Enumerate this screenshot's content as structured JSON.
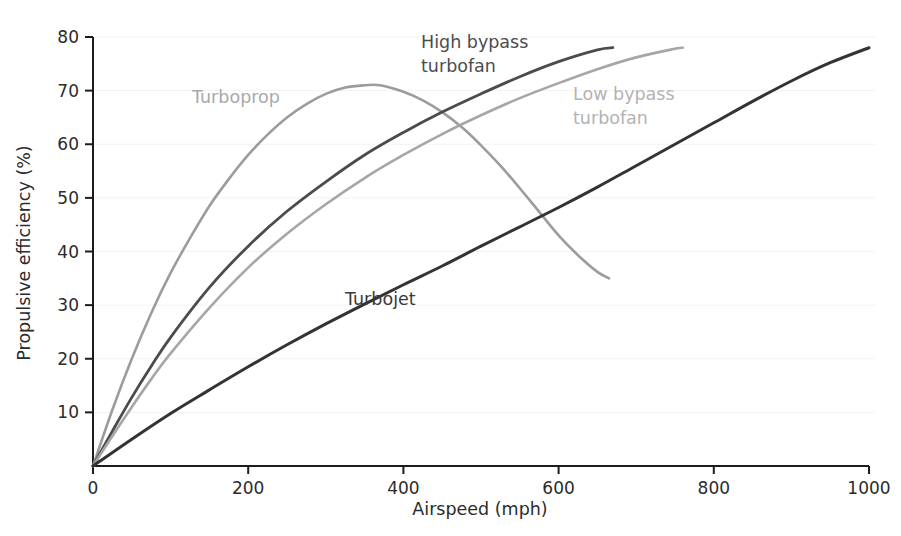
{
  "chart_data": {
    "type": "line",
    "title": "",
    "xlabel": "Airspeed (mph)",
    "ylabel": "Propulsive efficiency (%)",
    "xlim": [
      0,
      1000
    ],
    "ylim": [
      0,
      80
    ],
    "xticks": [
      "0",
      "200",
      "400",
      "600",
      "800",
      "1000"
    ],
    "yticks": [
      "10",
      "20",
      "30",
      "40",
      "50",
      "60",
      "70",
      "80"
    ],
    "xtick_values": [
      0,
      200,
      400,
      600,
      800,
      1000
    ],
    "ytick_values": [
      10,
      20,
      30,
      40,
      50,
      60,
      70,
      80
    ],
    "grid": true,
    "grid_axis": "y",
    "legend": "inline-annotations",
    "series": [
      {
        "name": "Turboprop",
        "color": "#9c9c9c",
        "label_x": 192,
        "label_y": 103,
        "x": [
          0,
          25,
          50,
          75,
          100,
          125,
          150,
          175,
          200,
          225,
          250,
          275,
          300,
          325,
          350,
          370,
          400,
          425,
          450,
          475,
          500,
          525,
          550,
          575,
          600,
          625,
          650,
          665
        ],
        "y": [
          0,
          10.5,
          20.0,
          28.5,
          36.0,
          42.5,
          48.5,
          53.5,
          58.0,
          61.8,
          65.0,
          67.5,
          69.4,
          70.6,
          71.0,
          71.0,
          69.8,
          68.2,
          66.0,
          63.2,
          59.8,
          56.0,
          51.8,
          47.4,
          43.0,
          39.3,
          36.2,
          35.0
        ]
      },
      {
        "name": "High bypass turbofan",
        "color": "#4b4b4b",
        "label_line1": "High bypass",
        "label_line2": "turbofan",
        "label_x": 421,
        "label_y": 48,
        "x": [
          0,
          25,
          50,
          75,
          100,
          150,
          200,
          250,
          300,
          350,
          400,
          450,
          500,
          550,
          600,
          650,
          670
        ],
        "y": [
          0,
          6.5,
          12.8,
          18.6,
          24.0,
          33.3,
          41.0,
          47.5,
          53.0,
          58.0,
          62.2,
          66.0,
          69.4,
          72.6,
          75.4,
          77.6,
          78.0
        ]
      },
      {
        "name": "Low bypass turbofan",
        "color": "#a6a6a6",
        "label_line1": "Low bypass",
        "label_line2": "turbofan",
        "label_x": 573,
        "label_y": 100,
        "x": [
          0,
          25,
          50,
          75,
          100,
          150,
          200,
          250,
          300,
          350,
          400,
          450,
          500,
          550,
          600,
          650,
          700,
          750,
          760
        ],
        "y": [
          0,
          5.6,
          11.0,
          16.2,
          21.0,
          29.5,
          37.0,
          43.3,
          48.8,
          53.7,
          58.0,
          61.9,
          65.4,
          68.6,
          71.4,
          74.0,
          76.2,
          77.8,
          78.0
        ]
      },
      {
        "name": "Turbojet",
        "color": "#333333",
        "label_x": 345,
        "label_y": 305,
        "x": [
          0,
          50,
          100,
          150,
          200,
          250,
          300,
          350,
          400,
          450,
          500,
          550,
          600,
          650,
          700,
          750,
          800,
          850,
          900,
          950,
          1000
        ],
        "y": [
          0,
          5.0,
          9.8,
          14.2,
          18.5,
          22.6,
          26.5,
          30.2,
          33.8,
          37.3,
          41.0,
          44.6,
          48.2,
          52.0,
          56.0,
          60.0,
          64.0,
          68.0,
          71.8,
          75.2,
          78.0
        ]
      }
    ]
  }
}
